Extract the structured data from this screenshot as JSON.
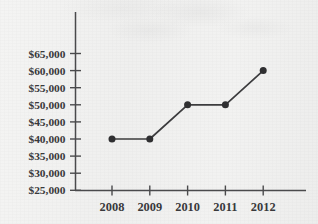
{
  "figure": {
    "background_color": "#f1f1f0",
    "ink_color": "#3c3c3e",
    "marker_color": "#2f2f31",
    "axis_color": "#4a4a4c",
    "media_note": "scanned textbook page; faint illegible show-through text along top edge"
  },
  "chart_data": {
    "type": "line",
    "title": "",
    "subtitle": "",
    "xlabel": "",
    "ylabel": "",
    "categories": [
      "2008",
      "2009",
      "2010",
      "2011",
      "2012"
    ],
    "values": [
      40000,
      40000,
      50000,
      50000,
      60000
    ],
    "value_labels": [
      "$40,000",
      "$40,000",
      "$50,000",
      "$50,000",
      "$60,000"
    ],
    "series": [
      {
        "name": "",
        "values": [
          40000,
          40000,
          50000,
          50000,
          60000
        ]
      }
    ],
    "x_tick_labels": [
      "2008",
      "2009",
      "2010",
      "2011",
      "2012"
    ],
    "y_tick_labels": [
      "$65,000",
      "$60,000",
      "$55,000",
      "$50,000",
      "$45,000",
      "$40,000",
      "$35,000",
      "$30,000",
      "$25,000"
    ],
    "y_tick_values": [
      65000,
      60000,
      55000,
      50000,
      45000,
      40000,
      35000,
      30000,
      25000
    ],
    "ylim": [
      25000,
      65000
    ],
    "y_tick_step": 5000,
    "grid": false,
    "legend": false,
    "legend_position": "none",
    "markers": "filled-circle",
    "annotations": []
  }
}
